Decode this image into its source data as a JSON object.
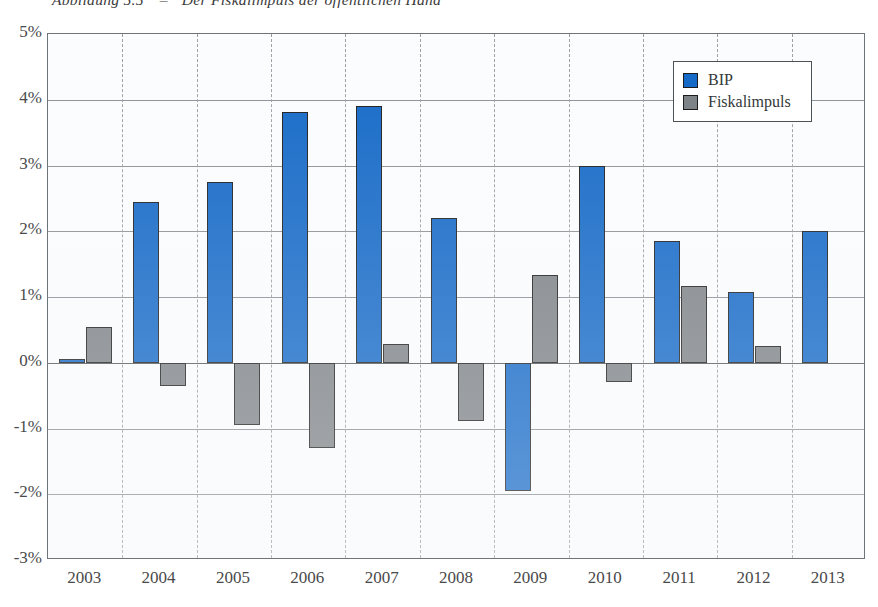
{
  "caption": {
    "figure_number": "Abbildung 5.5",
    "dash": "–",
    "title": "Der Fiskalimpuls der öffentlichen Hand"
  },
  "legend": {
    "position": "top-right",
    "items": [
      {
        "label": "BIP",
        "color": "#1569c7",
        "swatch": "bip"
      },
      {
        "label": "Fiskalimpuls",
        "color": "#7e8387",
        "swatch": "fisk"
      }
    ]
  },
  "axes": {
    "y_ticks": [
      "5%",
      "4%",
      "3%",
      "2%",
      "1%",
      "0%",
      "-1%",
      "-2%",
      "-3%"
    ],
    "y_values": [
      5,
      4,
      3,
      2,
      1,
      0,
      -1,
      -2,
      -3
    ],
    "x_ticks": [
      "2003",
      "2004",
      "2005",
      "2006",
      "2007",
      "2008",
      "2009",
      "2010",
      "2011",
      "2012",
      "2013"
    ]
  },
  "colors": {
    "bip": "#1569c7",
    "fiskalimpuls": "#7e8387",
    "axis": "#55595d",
    "grid": "#8b9096",
    "plot_background": "#fbfcfd"
  },
  "chart_data": {
    "type": "bar",
    "title": "Der Fiskalimpuls der öffentlichen Hand",
    "xlabel": "",
    "ylabel": "",
    "ylim": [
      -3,
      5
    ],
    "ytick_step": 1,
    "grid": true,
    "legend_position": "top-right",
    "categories": [
      "2003",
      "2004",
      "2005",
      "2006",
      "2007",
      "2008",
      "2009",
      "2010",
      "2011",
      "2012",
      "2013"
    ],
    "series": [
      {
        "name": "BIP",
        "color": "#1569c7",
        "values": [
          0.05,
          2.45,
          2.75,
          3.81,
          3.9,
          2.2,
          -1.95,
          3.0,
          1.85,
          1.08,
          2.0
        ]
      },
      {
        "name": "Fiskalimpuls",
        "color": "#7e8387",
        "values": [
          0.55,
          -0.35,
          -0.95,
          -1.3,
          0.28,
          -0.88,
          1.33,
          -0.3,
          1.16,
          0.25,
          null
        ]
      }
    ]
  }
}
